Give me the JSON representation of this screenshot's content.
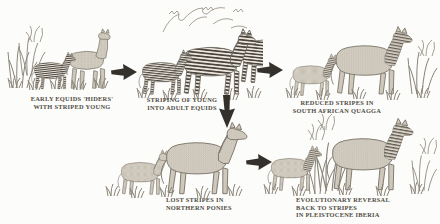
{
  "diagram": {
    "background_color": "#fcfcfa",
    "ink_color": "#6f6a60",
    "arrow_color": "#34312c",
    "caption_color": "#504c44"
  },
  "stages": [
    {
      "id": "early-equids",
      "caption_lines": [
        "EARLY EQUIDS 'HIDERS'",
        "WITH STRIPED YOUNG"
      ],
      "illustration": "plain-coated long-necked adult early equid standing behind a small striped foal among tall reeds"
    },
    {
      "id": "striped-adults",
      "caption_lines": [
        "STRIPING OF YOUNG",
        "INTO ADULT EQUIDS"
      ],
      "illustration": "fully striped adult zebras with a striped foal beneath sparse acacia branches"
    },
    {
      "id": "south-african-quagga",
      "caption_lines": [
        "REDUCED STRIPES IN",
        "SOUTH AFRICAN QUAGGA"
      ],
      "illustration": "adult quagga and foal with stripes restricted to the head and neck, shrub at right"
    },
    {
      "id": "northern-ponies",
      "caption_lines": [
        "LOST STRIPES IN",
        "NORTHERN PONIES"
      ],
      "illustration": "unstriped pony mare and foal standing in grass"
    },
    {
      "id": "pleistocene-iberia",
      "caption_lines": [
        "EVOLUTIONARY REVERSAL",
        "BACK TO STRIPES",
        "IN PLEISTOCENE IBERIA"
      ],
      "illustration": "horse mare and foal with re-emerged neck stripes among tall plants"
    }
  ],
  "arrows": [
    {
      "from": "early-equids",
      "to": "striped-adults",
      "direction": "right"
    },
    {
      "from": "striped-adults",
      "to": "south-african-quagga",
      "direction": "right"
    },
    {
      "from": "striped-adults",
      "to": "northern-ponies",
      "direction": "down"
    },
    {
      "from": "northern-ponies",
      "to": "pleistocene-iberia",
      "direction": "right"
    }
  ]
}
